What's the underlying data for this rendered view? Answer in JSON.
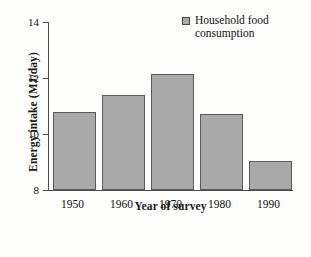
{
  "chart_data": {
    "type": "bar",
    "title": "",
    "categories": [
      "1950",
      "1960",
      "1970",
      "1980",
      "1990"
    ],
    "values": [
      10.8,
      11.4,
      12.15,
      10.7,
      9.05
    ],
    "series": [
      {
        "name": "Household food consumption",
        "values": [
          10.8,
          11.4,
          12.15,
          10.7,
          9.05
        ]
      }
    ],
    "xlabel": "Year of survey",
    "ylabel": "Energy intake (MJ/day)",
    "ylim": [
      8,
      14
    ],
    "yticks": [
      "8",
      "10",
      "12",
      "14"
    ],
    "ytick_values": [
      8,
      10,
      12,
      14
    ],
    "grid": false,
    "legend": {
      "position": "top-right",
      "entries": [
        "Household food consumption"
      ]
    },
    "colors": {
      "bar_fill": "#a9a9a9",
      "bar_edge": "#5a5a5a",
      "axis": "#4d4d4d",
      "text": "#111111",
      "background": "#fdfdfc"
    }
  },
  "legend": {
    "label": "Household food consumption",
    "swatch_icon": "legend-square-icon"
  },
  "axes": {
    "x_title": "Year of survey",
    "y_title": "Energy intake (MJ/day)"
  }
}
